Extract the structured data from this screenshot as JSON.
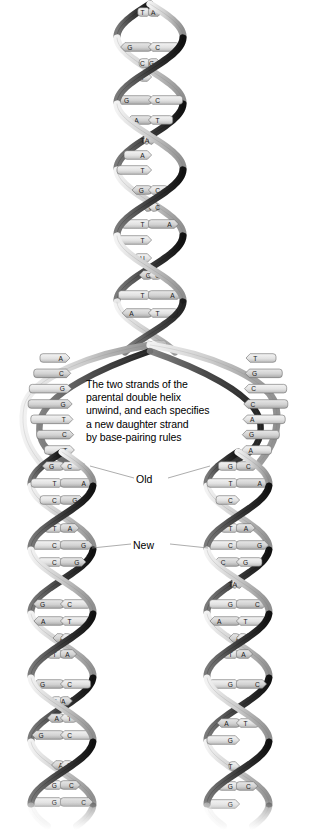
{
  "figure": {
    "background": "#ffffff",
    "caption": "The two strands of the\nparental double helix\nunwind, and each specifies\na new daughter strand\nby base-pairing rules",
    "labels": {
      "old": "Old",
      "new": "New"
    }
  },
  "colors": {
    "ribbon_light": "#d9d9d9",
    "ribbon_mid": "#b4b4b4",
    "ribbon_dark": "#6e6e6e",
    "ribbon_shadow": "#1c1c1c",
    "base_fill": "#e4e4e4",
    "base_fill_alt": "#cfcfcf",
    "outline": "#6b6b6b",
    "text": "#000000",
    "leader_line": "#8a8a8a"
  },
  "parent_helix": {
    "name": "parental-double-helix",
    "pairs": [
      {
        "left": "T",
        "right": "A",
        "dir": "right",
        "y": 12
      },
      {
        "left": "G",
        "right": "C",
        "dir": "left",
        "y": 47
      },
      {
        "left": "C",
        "right": "G",
        "dir": "right",
        "y": 63
      },
      {
        "left": "T",
        "right": "",
        "dir": "right",
        "y": 77
      },
      {
        "left": "G",
        "right": "C",
        "dir": "left",
        "y": 100
      },
      {
        "left": "A",
        "right": "T",
        "dir": "left",
        "y": 120
      },
      {
        "left": "T",
        "right": "A",
        "dir": "right",
        "y": 140
      },
      {
        "left": "A",
        "right": "",
        "dir": "right",
        "y": 155
      },
      {
        "left": "T",
        "right": "",
        "dir": "right",
        "y": 170
      },
      {
        "left": "G",
        "right": "C",
        "dir": "left",
        "y": 190
      },
      {
        "left": "G",
        "right": "C",
        "dir": "left",
        "y": 207
      },
      {
        "left": "T",
        "right": "A",
        "dir": "right",
        "y": 224
      },
      {
        "left": "T",
        "right": "",
        "dir": "right",
        "y": 240
      },
      {
        "left": "U",
        "right": "",
        "dir": "right",
        "y": 258
      },
      {
        "left": "G",
        "right": "C",
        "dir": "left",
        "y": 275
      },
      {
        "left": "T",
        "right": "A",
        "dir": "right",
        "y": 295
      },
      {
        "left": "A",
        "right": "T",
        "dir": "left",
        "y": 313
      },
      {
        "left": "G",
        "right": "C",
        "dir": "left",
        "y": 345
      }
    ]
  },
  "fork": {
    "name": "replication-fork",
    "left_unpaired": [
      "A",
      "C",
      "G",
      "G",
      "T",
      "C",
      "T"
    ],
    "right_unpaired": [
      "T",
      "G",
      "C",
      "C",
      "A",
      "G",
      "A"
    ]
  },
  "daughter_left": {
    "name": "daughter-helix-left",
    "pairs": [
      {
        "left": "G",
        "right": "C",
        "dir": "left",
        "y": 466
      },
      {
        "left": "T",
        "right": "A",
        "dir": "right",
        "y": 483
      },
      {
        "left": "C",
        "right": "G",
        "dir": "right",
        "y": 500
      },
      {
        "left": "T",
        "right": "A",
        "dir": "right",
        "y": 528
      },
      {
        "left": "C",
        "right": "G",
        "dir": "right",
        "y": 545
      },
      {
        "left": "C",
        "right": "G",
        "dir": "right",
        "y": 562
      },
      {
        "left": "T",
        "right": "",
        "dir": "right",
        "y": 578
      },
      {
        "left": "G",
        "right": "C",
        "dir": "left",
        "y": 604
      },
      {
        "left": "A",
        "right": "T",
        "dir": "left",
        "y": 621
      },
      {
        "left": "A",
        "right": "T",
        "dir": "left",
        "y": 638
      },
      {
        "left": "T",
        "right": "A",
        "dir": "right",
        "y": 654
      },
      {
        "left": "G",
        "right": "C",
        "dir": "left",
        "y": 684
      },
      {
        "left": "T",
        "right": "A",
        "dir": "right",
        "y": 701
      },
      {
        "left": "A",
        "right": "T",
        "dir": "left",
        "y": 718
      },
      {
        "left": "G",
        "right": "C",
        "dir": "left",
        "y": 735
      },
      {
        "left": "A",
        "right": "T",
        "dir": "left",
        "y": 765
      },
      {
        "left": "G",
        "right": "C",
        "dir": "right",
        "y": 785
      },
      {
        "left": "G",
        "right": "C",
        "dir": "right",
        "y": 802
      }
    ]
  },
  "daughter_right": {
    "name": "daughter-helix-right",
    "pairs": [
      {
        "left": "G",
        "right": "C",
        "dir": "right",
        "y": 466
      },
      {
        "left": "T",
        "right": "A",
        "dir": "right",
        "y": 483
      },
      {
        "left": "C",
        "right": "",
        "dir": "right",
        "y": 500
      },
      {
        "left": "T",
        "right": "A",
        "dir": "right",
        "y": 528
      },
      {
        "left": "C",
        "right": "G",
        "dir": "right",
        "y": 545
      },
      {
        "left": "C",
        "right": "G",
        "dir": "left",
        "y": 562
      },
      {
        "left": "T",
        "right": "A",
        "dir": "right",
        "y": 584
      },
      {
        "left": "G",
        "right": "C",
        "dir": "right",
        "y": 604
      },
      {
        "left": "A",
        "right": "T",
        "dir": "left",
        "y": 621
      },
      {
        "left": "A",
        "right": "T",
        "dir": "left",
        "y": 638
      },
      {
        "left": "T",
        "right": "A",
        "dir": "right",
        "y": 654
      },
      {
        "left": "G",
        "right": "C",
        "dir": "right",
        "y": 684
      },
      {
        "left": "T",
        "right": "A",
        "dir": "right",
        "y": 706
      },
      {
        "left": "A",
        "right": "T",
        "dir": "left",
        "y": 723
      },
      {
        "left": "G",
        "right": "",
        "dir": "right",
        "y": 740
      },
      {
        "left": "T",
        "right": "",
        "dir": "right",
        "y": 766
      },
      {
        "left": "G",
        "right": "C",
        "dir": "right",
        "y": 786
      },
      {
        "left": "G",
        "right": "",
        "dir": "right",
        "y": 804
      }
    ]
  }
}
